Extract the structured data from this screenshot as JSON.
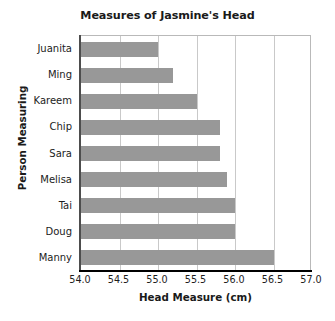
{
  "chart_data": {
    "type": "bar",
    "orientation": "horizontal",
    "title": "Measures of Jasmine's Head",
    "xlabel": "Head Measure (cm)",
    "ylabel": "Person Measuring",
    "categories": [
      "Juanita",
      "Ming",
      "Kareem",
      "Chip",
      "Sara",
      "Melisa",
      "Tai",
      "Doug",
      "Manny"
    ],
    "values": [
      55.0,
      55.2,
      55.5,
      55.8,
      55.8,
      55.9,
      56.0,
      56.0,
      56.5
    ],
    "xlim": [
      54.0,
      57.0
    ],
    "xticks": [
      "54.0",
      "54.5",
      "55.0",
      "55.5",
      "56.0",
      "56.5",
      "57.0"
    ],
    "xtick_values": [
      54.0,
      54.5,
      55.0,
      55.5,
      56.0,
      56.5,
      57.0
    ],
    "grid": "vertical",
    "legend": "none",
    "bar_color": "#989898",
    "plot_background": "#ffffff",
    "gridline_color": "#c9c9c9",
    "axis_color": "#000000"
  }
}
